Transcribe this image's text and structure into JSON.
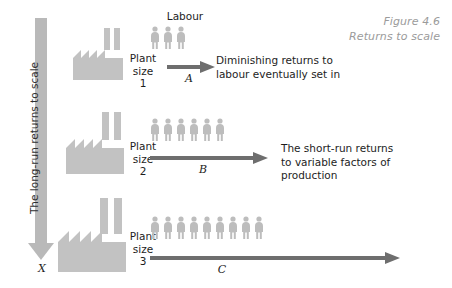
{
  "figure": {
    "caption_number": "Figure 4.6",
    "caption_title": "Returns to scale"
  },
  "vertical_axis": {
    "label": "The long-run returns to scale",
    "end_marker": "X",
    "arrow_icon": "down-arrow-icon",
    "color": "#b9b9b9"
  },
  "labour_heading": "Labour",
  "rows": [
    {
      "id": "row-1",
      "factory_icon": "factory-icon",
      "plant_label_line1": "Plant",
      "plant_label_line2": "size",
      "plant_label_line3": "1",
      "worker_count": 3,
      "arrow_letter": "A",
      "arrow_icon": "right-arrow-icon",
      "note_lines": [
        "Diminishing returns to",
        "labour eventually set in"
      ]
    },
    {
      "id": "row-2",
      "factory_icon": "factory-icon",
      "plant_label_line1": "Plant",
      "plant_label_line2": "size",
      "plant_label_line3": "2",
      "worker_count": 6,
      "arrow_letter": "B",
      "arrow_icon": "right-arrow-icon",
      "note_lines": [
        "The short-run returns",
        "to variable factors of",
        "production"
      ]
    },
    {
      "id": "row-3",
      "factory_icon": "factory-icon",
      "plant_label_line1": "Plant",
      "plant_label_line2": "size",
      "plant_label_line3": "3",
      "worker_count": 9,
      "arrow_letter": "C",
      "arrow_icon": "right-arrow-icon",
      "note_lines": []
    }
  ],
  "colors": {
    "factory": "#c2c2c2",
    "worker": "#bdbdbd",
    "arrow": "#6e6e6e",
    "caption": "#9b9b9b",
    "text": "#1d1d1d"
  }
}
